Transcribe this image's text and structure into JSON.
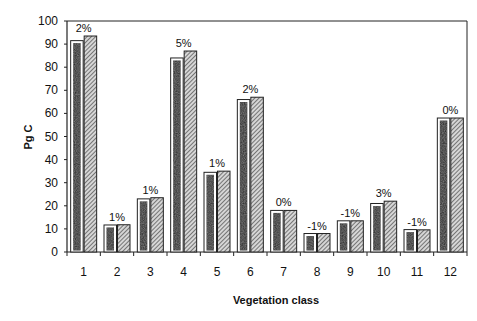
{
  "chart_data": {
    "type": "bar",
    "title": "",
    "xlabel": "Vegetation class",
    "ylabel": "Pg C",
    "ylim": [
      0,
      100
    ],
    "yticks": [
      0,
      10,
      20,
      30,
      40,
      50,
      60,
      70,
      80,
      90,
      100
    ],
    "grid": false,
    "legend": "none",
    "categories": [
      "1",
      "2",
      "3",
      "4",
      "5",
      "6",
      "7",
      "8",
      "9",
      "10",
      "11",
      "12"
    ],
    "series": [
      {
        "name": "Series A (dark stippled)",
        "values": [
          91.5,
          11.7,
          23,
          84,
          34.5,
          66,
          18,
          8,
          13.5,
          21,
          9.7,
          58
        ]
      },
      {
        "name": "Series B (hatched)",
        "values": [
          93.5,
          11.8,
          23.5,
          87,
          35,
          67,
          18,
          8,
          13.5,
          22,
          9.6,
          58
        ]
      }
    ],
    "annotations": [
      "2%",
      "1%",
      "1%",
      "5%",
      "1%",
      "2%",
      "0%",
      "-1%",
      "-1%",
      "3%",
      "-1%",
      "0%"
    ]
  },
  "colors": {
    "dark_bar": "#1c1c1c",
    "hatch_fill": "#d0d0d0",
    "hatch_line": "#333333",
    "axis": "#222222"
  }
}
